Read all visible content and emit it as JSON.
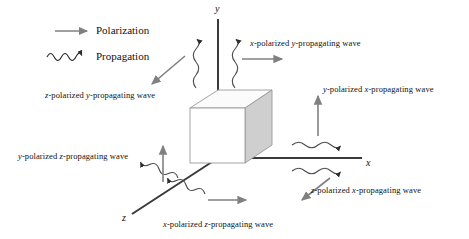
{
  "figure": {
    "kind": "3d-axis-wave-polarization-diagram",
    "background_color": "#ffffff",
    "line_color": "#3a3a3a",
    "arrow_color": "#7a7a7a",
    "wave_color": "#4a4a4a",
    "cube_front_color": "#ffffff",
    "cube_side_color": "#cfcfcf",
    "cube_top_color": "#fbfbfb",
    "cube_edge_color": "#9a9a9a"
  },
  "legend": {
    "items": [
      {
        "icon": "straight-arrow-icon",
        "label": "Polarization"
      },
      {
        "icon": "wavy-arrow-icon",
        "label": "Propagation"
      }
    ]
  },
  "axes": [
    {
      "name": "y-axis",
      "label": "y",
      "direction": "up"
    },
    {
      "name": "x-axis",
      "label": "x",
      "direction": "right"
    },
    {
      "name": "z-axis",
      "label": "z",
      "direction": "down-left"
    }
  ],
  "cube": {
    "name": "crystal-cube",
    "label": ""
  },
  "waves": [
    {
      "id": "z-pol-y-prop",
      "polarization": "z",
      "propagation": "y",
      "text_prefix": "z",
      "text_mid": "-polarized ",
      "text_axis2": "y",
      "text_suffix": "-propagating wave",
      "full_text": "z-polarized y-propagating wave"
    },
    {
      "id": "x-pol-y-prop",
      "polarization": "x",
      "propagation": "y",
      "text_prefix": "x",
      "text_mid": "-polarized ",
      "text_axis2": "y",
      "text_suffix": "-propagating wave",
      "full_text": "x-polarized y-propagating wave"
    },
    {
      "id": "y-pol-x-prop",
      "polarization": "y",
      "propagation": "x",
      "text_prefix": "y",
      "text_mid": "-polarized ",
      "text_axis2": "x",
      "text_suffix": "-propagating wave",
      "full_text": "y-polarized x-propagating wave"
    },
    {
      "id": "z-pol-x-prop",
      "polarization": "z",
      "propagation": "x",
      "text_prefix": "z",
      "text_mid": "-polarized ",
      "text_axis2": "x",
      "text_suffix": "-propagating wave",
      "full_text": "z-polarized x-propagating wave"
    },
    {
      "id": "y-pol-z-prop",
      "polarization": "y",
      "propagation": "z",
      "text_prefix": "y",
      "text_mid": "-polarized ",
      "text_axis2": "z",
      "text_suffix": "-propagating wave",
      "full_text": "y-polarized z-propagating wave"
    },
    {
      "id": "x-pol-z-prop",
      "polarization": "x",
      "propagation": "z",
      "text_prefix": "x",
      "text_mid": "-polarized ",
      "text_axis2": "z",
      "text_suffix": "-propagating wave",
      "full_text": "x-polarized z-propagating wave"
    }
  ]
}
